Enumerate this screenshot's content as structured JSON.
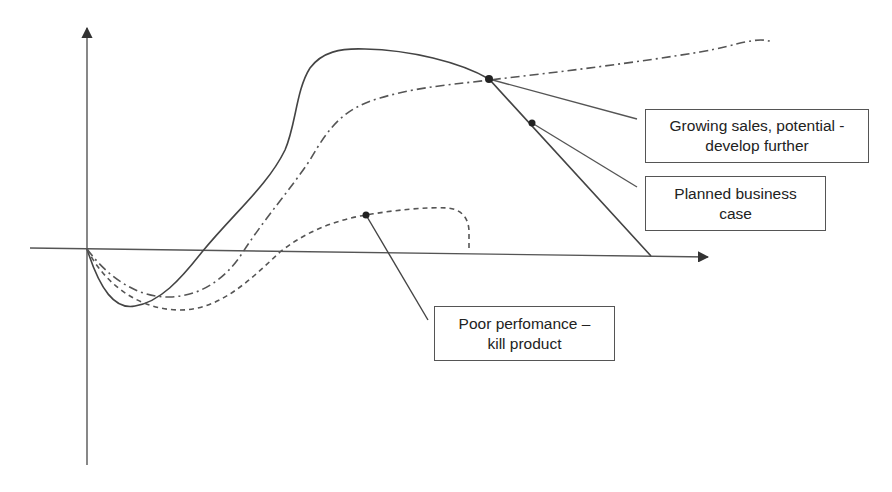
{
  "diagram": {
    "type": "product lifecycle decision curves",
    "axes": {
      "origin": [
        87,
        249
      ],
      "x_axis_end": [
        710,
        257
      ],
      "y_axis_top": [
        87,
        26
      ],
      "y_axis_bottom": [
        87,
        465
      ]
    },
    "curves": [
      {
        "name": "develop-further-curve",
        "style": "solid",
        "color": "#444444"
      },
      {
        "name": "planned-business-case-curve",
        "style": "dash-dot",
        "color": "#555555"
      },
      {
        "name": "poor-performance-curve",
        "style": "dashed",
        "color": "#555555"
      }
    ],
    "callouts": [
      {
        "id": "growing-sales",
        "line1": "Growing sales, potential -",
        "line2": "develop further"
      },
      {
        "id": "planned-case",
        "line1": "Planned business",
        "line2": "case"
      },
      {
        "id": "poor-performance",
        "line1": "Poor perfomance –",
        "line2": "kill product"
      }
    ]
  }
}
